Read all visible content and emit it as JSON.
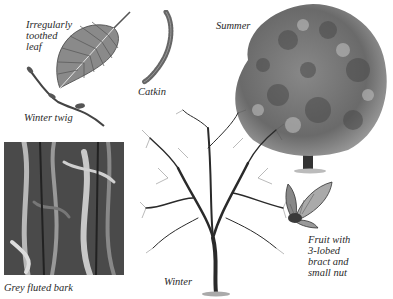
{
  "plate": {
    "subject": "Tree species identification plate",
    "labels": {
      "leaf": "Irregularly\ntoothed\nleaf",
      "catkin": "Catkin",
      "winter_twig": "Winter twig",
      "summer": "Summer",
      "bark": "Grey fluted bark",
      "winter": "Winter",
      "fruit": "Fruit with\n3-lobed\nbract and\nsmall nut"
    },
    "colors": {
      "background": "#ffffff",
      "ink": "#2a2a2a",
      "foliage_dark": "#4a4a4a",
      "foliage_light": "#9a9a9a",
      "bark_dark": "#3a3a3a",
      "bark_light": "#b8b8b8"
    }
  }
}
